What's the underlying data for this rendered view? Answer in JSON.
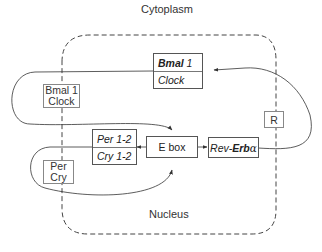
{
  "regions": {
    "cytoplasm": "Cytoplasm",
    "nucleus": "Nucleus"
  },
  "nodes": {
    "bmal_clock_cyto": {
      "line1": "Bmal 1",
      "line2": "Clock"
    },
    "bmal_clock_nuc": {
      "line1_bold": "Bmal",
      "line1_rest": " 1",
      "line2": "Clock"
    },
    "r": {
      "label": "R"
    },
    "per_cry_12": {
      "line1": "Per 1-2",
      "line2": "Cry 1-2"
    },
    "ebox": {
      "label": "E box"
    },
    "rev_erb": {
      "prefix": "Rev-",
      "bold": "Erb",
      "suffix": "α"
    },
    "per_cry_cyto": {
      "line1": "Per",
      "line2": "Cry"
    }
  },
  "colors": {
    "line": "#333333",
    "dash": "#444444",
    "box_border": "#555555"
  }
}
